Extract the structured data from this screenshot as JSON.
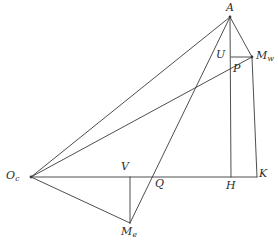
{
  "figure": {
    "background_color": "#ffffff",
    "stroke_color": "#3a3a3a",
    "label_color": "#2b2b2b",
    "width": 278,
    "height": 243
  },
  "labels": {
    "A": {
      "text": "A",
      "sub": "",
      "x": 226,
      "y": 2
    },
    "Mw": {
      "text": "M",
      "sub": "w",
      "x": 256,
      "y": 50
    },
    "U": {
      "text": "U",
      "sub": "",
      "x": 216,
      "y": 49
    },
    "P": {
      "text": "P",
      "sub": "",
      "x": 233,
      "y": 63
    },
    "Oc": {
      "text": "O",
      "sub": "c",
      "x": 6,
      "y": 170
    },
    "V": {
      "text": "V",
      "sub": "",
      "x": 121,
      "y": 161
    },
    "Q": {
      "text": "Q",
      "sub": "",
      "x": 155,
      "y": 178
    },
    "H": {
      "text": "H",
      "sub": "",
      "x": 226,
      "y": 180
    },
    "K": {
      "text": "K",
      "sub": "",
      "x": 259,
      "y": 168
    },
    "Me": {
      "text": "M",
      "sub": "e",
      "x": 121,
      "y": 226
    }
  },
  "points": {
    "A": {
      "x": 230,
      "y": 17
    },
    "Mw": {
      "x": 252,
      "y": 57
    },
    "U": {
      "x": 231,
      "y": 57
    },
    "P": {
      "x": 231,
      "y": 64
    },
    "Oc": {
      "x": 31,
      "y": 177
    },
    "V": {
      "x": 130,
      "y": 177
    },
    "Q": {
      "x": 152,
      "y": 177
    },
    "H": {
      "x": 231,
      "y": 177
    },
    "K": {
      "x": 257,
      "y": 177
    },
    "Me": {
      "x": 130,
      "y": 223
    }
  },
  "segments": [
    {
      "name": "baseline-Oc-K",
      "from": "Oc",
      "to": "K"
    },
    {
      "name": "side-Oc-A",
      "from": "Oc",
      "to": "A"
    },
    {
      "name": "line-Oc-Mw",
      "from": "Oc",
      "to": "Mw"
    },
    {
      "name": "side-Oc-Me",
      "from": "Oc",
      "to": "Me"
    },
    {
      "name": "altitude-A-H",
      "from": "A",
      "to": "H"
    },
    {
      "name": "side-A-Mw",
      "from": "A",
      "to": "Mw"
    },
    {
      "name": "cevian-A-Me",
      "from": "A",
      "to": "Me"
    },
    {
      "name": "segment-U-Mw",
      "from": "U",
      "to": "Mw"
    },
    {
      "name": "side-Mw-K",
      "from": "Mw",
      "to": "K"
    },
    {
      "name": "segment-V-Me",
      "from": "V",
      "to": "Me"
    }
  ],
  "vertex_dots": [
    "Oc",
    "A",
    "Mw"
  ]
}
